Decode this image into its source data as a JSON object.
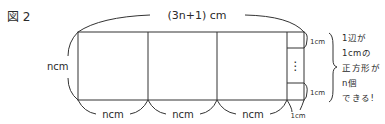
{
  "figure": {
    "label": "図 2",
    "top_dimension": "(3n+1) cm",
    "left_dimension": "ncm",
    "bottom_dimensions": [
      "ncm",
      "ncm",
      "ncm",
      "1cm"
    ],
    "small_square_top_label": "1cm",
    "small_square_bottom_label": "1cm",
    "ellipsis": "⋮",
    "note_lines": [
      "1辺が",
      "1cmの",
      "正方形が",
      "n個",
      "できる!"
    ]
  }
}
